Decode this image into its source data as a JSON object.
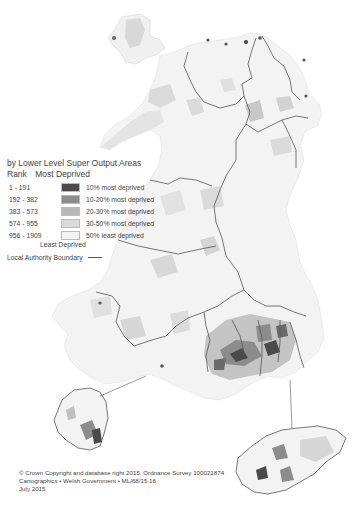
{
  "legend": {
    "subtitle": "by Lower Level Super Output Areas",
    "rank_label": "Rank",
    "most_label": "Most Deprived",
    "least_label": "Least Deprived",
    "classes": [
      {
        "range": "1 - 191",
        "label": "10% most deprived",
        "color": "#4a4a4a"
      },
      {
        "range": "192 - 382",
        "label": "10-20% most deprived",
        "color": "#8c8c8c"
      },
      {
        "range": "383 - 573",
        "label": "20-30% most deprived",
        "color": "#b8b8b8"
      },
      {
        "range": "574 - 955",
        "label": "30-50% most deprived",
        "color": "#dadada"
      },
      {
        "range": "956 - 1909",
        "label": "50% least deprived",
        "color": "#f3f3f3"
      }
    ],
    "boundary_label": "Local Authority Boundary"
  },
  "credits": {
    "line1": "© Crown Copyright and database right 2015. Ordnance Survey 100021874",
    "line2": "Cartographics • Welsh Government • ML/68/15.16",
    "line3": "July 2015"
  },
  "colors": {
    "boundary": "#555555",
    "land": "#f3f3f3"
  }
}
